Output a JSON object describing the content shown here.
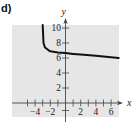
{
  "figure": {
    "label": "d)"
  },
  "colors": {
    "background": "#e6e6e6",
    "axis": "#444444",
    "curve": "#111111",
    "text": "#222222"
  },
  "chart_data": {
    "type": "line",
    "title": "",
    "xlabel": "x",
    "ylabel": "y",
    "xlim": [
      -6.9,
      7.1
    ],
    "ylim": [
      -1.8,
      10.5
    ],
    "x_ticks": [
      -5,
      -4,
      -3,
      -2,
      -1,
      1,
      2,
      3,
      4,
      5,
      6
    ],
    "x_tick_labels": [
      "-4",
      "-2",
      "2",
      "4",
      "6"
    ],
    "x_tick_label_values": [
      -4,
      -2,
      2,
      4,
      6
    ],
    "y_ticks": [
      -1,
      2,
      4,
      6,
      8,
      10
    ],
    "y_tick_labels": [
      "2",
      "4",
      "6",
      "8",
      "10"
    ],
    "y_tick_label_values": [
      2,
      4,
      6,
      8,
      10
    ],
    "grid": false,
    "legend": null,
    "series": [
      {
        "name": "f(x)",
        "vertical_asymptote": -3,
        "x": [
          -3.0,
          -2.9,
          -2.7,
          -2.3,
          -2.0,
          -1.0,
          0.0,
          1.0,
          2.0,
          4.0,
          6.0,
          7.0
        ],
        "y": [
          10.5,
          8.0,
          7.4,
          7.1,
          6.9,
          6.75,
          6.65,
          6.55,
          6.45,
          6.3,
          6.1,
          6.0
        ]
      }
    ]
  }
}
